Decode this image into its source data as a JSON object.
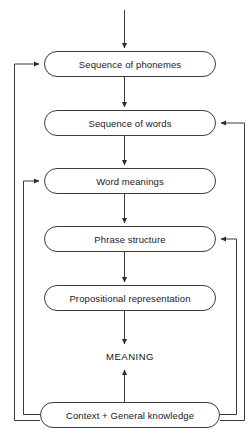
{
  "diagram": {
    "type": "flowchart",
    "style": {
      "stroke": "#3a3a3a",
      "box_fill": "#ffffff",
      "text_color": "#1a1a1a",
      "background": "#ffffff"
    },
    "nodes": [
      {
        "id": "phonemes",
        "label": "Sequence of phonemes",
        "shape": "stadium",
        "x": 44,
        "y": 51,
        "w": 172,
        "h": 26
      },
      {
        "id": "words",
        "label": "Sequence of words",
        "shape": "stadium",
        "x": 44,
        "y": 110,
        "w": 172,
        "h": 26
      },
      {
        "id": "word-meanings",
        "label": "Word meanings",
        "shape": "stadium",
        "x": 44,
        "y": 168,
        "w": 172,
        "h": 26
      },
      {
        "id": "phrase-structure",
        "label": "Phrase structure",
        "shape": "stadium",
        "x": 44,
        "y": 226,
        "w": 172,
        "h": 26
      },
      {
        "id": "propositional",
        "label": "Propositional representation",
        "shape": "stadium",
        "x": 44,
        "y": 285,
        "w": 172,
        "h": 26
      },
      {
        "id": "meaning",
        "label": "MEANING",
        "shape": "text",
        "x": 84,
        "y": 347,
        "w": 92,
        "h": 18
      },
      {
        "id": "context",
        "label": "Context + General knowledge",
        "shape": "stadium",
        "x": 40,
        "y": 402,
        "w": 180,
        "h": 26
      }
    ],
    "edges": [
      {
        "id": "input-to-phonemes",
        "from": "input",
        "to": "phonemes",
        "kind": "down-arrow"
      },
      {
        "id": "phonemes-to-words",
        "from": "phonemes",
        "to": "words",
        "kind": "down-arrow"
      },
      {
        "id": "words-to-word-meanings",
        "from": "words",
        "to": "word-meanings",
        "kind": "down-arrow"
      },
      {
        "id": "word-meanings-to-phrase-structure",
        "from": "word-meanings",
        "to": "phrase-structure",
        "kind": "down-arrow"
      },
      {
        "id": "phrase-structure-to-propositional",
        "from": "phrase-structure",
        "to": "propositional",
        "kind": "down-arrow"
      },
      {
        "id": "propositional-to-meaning",
        "from": "propositional",
        "to": "meaning",
        "kind": "down-arrow"
      },
      {
        "id": "context-to-meaning",
        "from": "context",
        "to": "meaning",
        "kind": "up-arrow"
      },
      {
        "id": "context-to-phonemes",
        "from": "context",
        "to": "phonemes",
        "kind": "feedback-left-outer"
      },
      {
        "id": "context-to-word-meanings",
        "from": "context",
        "to": "word-meanings",
        "kind": "feedback-left-inner"
      },
      {
        "id": "context-to-words",
        "from": "context",
        "to": "words",
        "kind": "feedback-right-outer"
      },
      {
        "id": "context-to-phrase-structure",
        "from": "context",
        "to": "phrase-structure",
        "kind": "feedback-right-inner"
      }
    ]
  }
}
